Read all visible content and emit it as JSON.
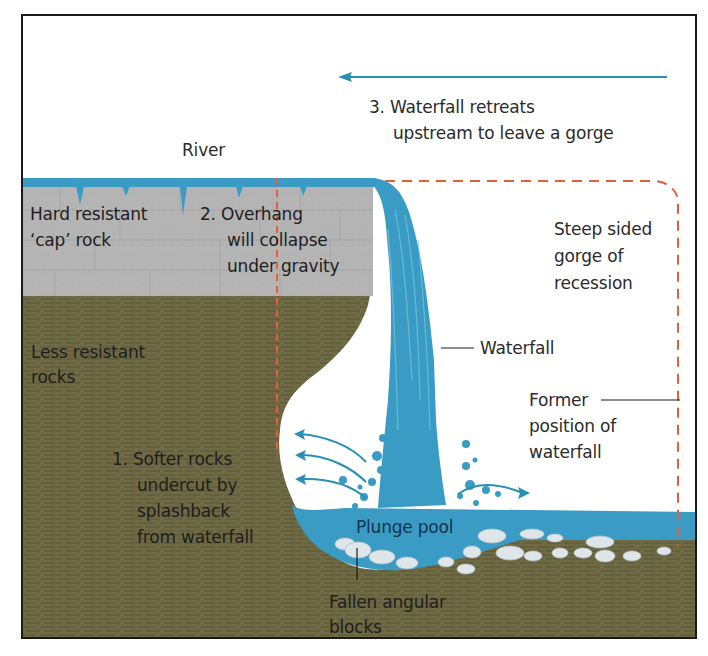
{
  "diagram": {
    "colors": {
      "water": "#3a9cc4",
      "water_light": "#5fb4d6",
      "cap_rock": "#b3b3b3",
      "cap_rock_lines": "#9a9a9a",
      "soft_rock": "#6e6a44",
      "soft_rock_lines": "#585433",
      "dashed_outline": "#e0603a",
      "arrow": "#2a8fb5",
      "boulder": "#dde4e8",
      "frame": "#1a1a1a"
    },
    "labels": {
      "river": "River",
      "retreat_line1": "3. Waterfall retreats",
      "retreat_line2": "upstream to leave a gorge",
      "cap_rock_line1": "Hard resistant",
      "cap_rock_line2": "‘cap’ rock",
      "overhang_line1": "2. Overhang",
      "overhang_line2": "will collapse",
      "overhang_line3": "under gravity",
      "gorge_line1": "Steep sided",
      "gorge_line2": "gorge of",
      "gorge_line3": "recession",
      "waterfall": "Waterfall",
      "less_resistant_line1": "Less resistant",
      "less_resistant_line2": "rocks",
      "former_line1": "Former",
      "former_line2": "position of",
      "former_line3": "waterfall",
      "softer_line1": "1. Softer rocks",
      "softer_line2": "undercut by",
      "softer_line3": "splashback",
      "softer_line4": "from waterfall",
      "plunge_pool": "Plunge pool",
      "fallen_line1": "Fallen angular",
      "fallen_line2": "blocks"
    }
  }
}
